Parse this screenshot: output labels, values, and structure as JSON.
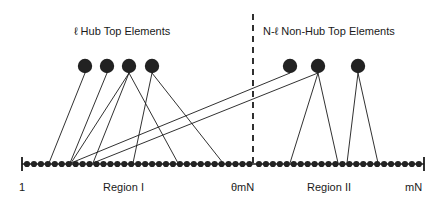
{
  "figure": {
    "type": "diagram",
    "width": 439,
    "height": 206,
    "colors": {
      "stroke": "#1a1a1a",
      "node_fill": "#222222",
      "background": "#ffffff",
      "text": "#1a1a1a"
    }
  },
  "labels": {
    "hub_group": "ℓ  Hub Top Elements",
    "nonhub_group": "N-ℓ  Non-Hub Top Elements",
    "axis_start": "1",
    "axis_mid": "θmN",
    "axis_end": "mN",
    "region_one": "Region I",
    "region_two": "Region II"
  },
  "axis": {
    "y": 164,
    "x_start": 22,
    "x_end": 424,
    "tick_height": 14,
    "divider_x": 253,
    "divider_top": 14,
    "divider_bottom": 168,
    "dot_radius": 3.1,
    "region_one_dot_count": 33,
    "region_one_dot_x0": 27,
    "region_one_dot_dx": 6.95,
    "region_two_dot_count": 24,
    "region_two_dot_x0": 259,
    "region_two_dot_dx": 6.95
  },
  "top_nodes": [
    {
      "id": "hub-1",
      "group": "hub",
      "x": 85,
      "y": 66,
      "r": 7.2
    },
    {
      "id": "hub-2",
      "group": "hub",
      "x": 107,
      "y": 66,
      "r": 7.2
    },
    {
      "id": "hub-3",
      "group": "hub",
      "x": 129,
      "y": 66,
      "r": 7.2
    },
    {
      "id": "hub-4",
      "group": "hub",
      "x": 152,
      "y": 66,
      "r": 7.2
    },
    {
      "id": "nonhub-1",
      "group": "non-hub",
      "x": 290,
      "y": 66,
      "r": 7.2
    },
    {
      "id": "nonhub-2",
      "group": "non-hub",
      "x": 318,
      "y": 66,
      "r": 7.2
    },
    {
      "id": "nonhub-3",
      "group": "non-hub",
      "x": 358,
      "y": 66,
      "r": 7.2
    }
  ],
  "edges": [
    {
      "from": "hub-1",
      "x1": 85,
      "y1": 73,
      "x2": 49,
      "y2": 163
    },
    {
      "from": "hub-2",
      "x1": 107,
      "y1": 73,
      "x2": 70,
      "y2": 163
    },
    {
      "from": "hub-3",
      "x1": 129,
      "y1": 73,
      "x2": 71,
      "y2": 163
    },
    {
      "from": "hub-3",
      "x1": 129,
      "y1": 73,
      "x2": 93,
      "y2": 163
    },
    {
      "from": "hub-3",
      "x1": 129,
      "y1": 73,
      "x2": 178,
      "y2": 163
    },
    {
      "from": "hub-4",
      "x1": 152,
      "y1": 73,
      "x2": 133,
      "y2": 163
    },
    {
      "from": "hub-4",
      "x1": 152,
      "y1": 73,
      "x2": 223,
      "y2": 163
    },
    {
      "from": "nonhub-1",
      "x1": 290,
      "y1": 73,
      "x2": 71,
      "y2": 163
    },
    {
      "from": "nonhub-2",
      "x1": 318,
      "y1": 73,
      "x2": 93,
      "y2": 163
    },
    {
      "from": "nonhub-2",
      "x1": 318,
      "y1": 73,
      "x2": 290,
      "y2": 163
    },
    {
      "from": "nonhub-2",
      "x1": 318,
      "y1": 73,
      "x2": 338,
      "y2": 163
    },
    {
      "from": "nonhub-3",
      "x1": 358,
      "y1": 73,
      "x2": 347,
      "y2": 163
    },
    {
      "from": "nonhub-3",
      "x1": 358,
      "y1": 73,
      "x2": 378,
      "y2": 163
    }
  ]
}
